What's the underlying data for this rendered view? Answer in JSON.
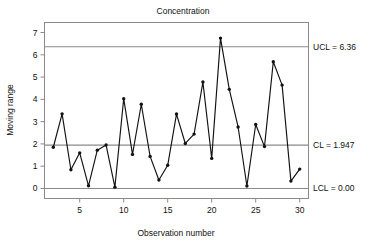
{
  "chart_data": {
    "type": "line",
    "title": "Concentration",
    "xlabel": "Observation number",
    "ylabel": "Moving range",
    "xlim": [
      1,
      31
    ],
    "ylim": [
      -0.45,
      7.45
    ],
    "grid": false,
    "legend": "none",
    "x": [
      2,
      3,
      4,
      5,
      6,
      7,
      8,
      9,
      10,
      11,
      12,
      13,
      14,
      15,
      16,
      17,
      18,
      19,
      20,
      21,
      22,
      23,
      24,
      25,
      26,
      27,
      28,
      29,
      30
    ],
    "values": [
      1.85,
      3.35,
      0.84,
      1.6,
      0.12,
      1.72,
      1.95,
      0.06,
      4.03,
      1.53,
      3.78,
      1.44,
      0.38,
      1.04,
      3.34,
      2.02,
      2.44,
      4.78,
      1.35,
      6.75,
      4.45,
      2.76,
      0.11,
      2.87,
      1.88,
      5.69,
      4.64,
      0.33,
      0.87
    ],
    "series": [
      {
        "name": "Moving range",
        "values": [
          1.85,
          3.35,
          0.84,
          1.6,
          0.12,
          1.72,
          1.95,
          0.06,
          4.03,
          1.53,
          3.78,
          1.44,
          0.38,
          1.04,
          3.34,
          2.02,
          2.44,
          4.78,
          1.35,
          6.75,
          4.45,
          2.76,
          0.11,
          2.87,
          1.88,
          5.69,
          4.64,
          0.33,
          0.87
        ]
      }
    ],
    "x_ticks": [
      5,
      10,
      15,
      20,
      25,
      30
    ],
    "x_tick_labels": [
      "5",
      "10",
      "15",
      "20",
      "25",
      "30"
    ],
    "y_ticks": [
      0,
      1,
      2,
      3,
      4,
      5,
      6,
      7
    ],
    "y_tick_labels": [
      "0",
      "1",
      "2",
      "3",
      "4",
      "5",
      "6",
      "7"
    ],
    "control_limits": [
      {
        "key": "ucl",
        "value": 6.36,
        "label": "UCL = 6.36"
      },
      {
        "key": "cl",
        "value": 1.947,
        "label": "CL = 1.947"
      },
      {
        "key": "lcl",
        "value": 0.0,
        "label": "LCL = 0.00"
      }
    ],
    "colors": {
      "line": "#111111",
      "marker": "#111111",
      "limit": "#8a8a8a",
      "frame": "#8a8a8a",
      "background": "#ffffff"
    }
  },
  "labels": {
    "ucl_text": "UCL = 6.36",
    "cl_text": "CL = 1.947",
    "lcl_text": "LCL = 0.00"
  }
}
